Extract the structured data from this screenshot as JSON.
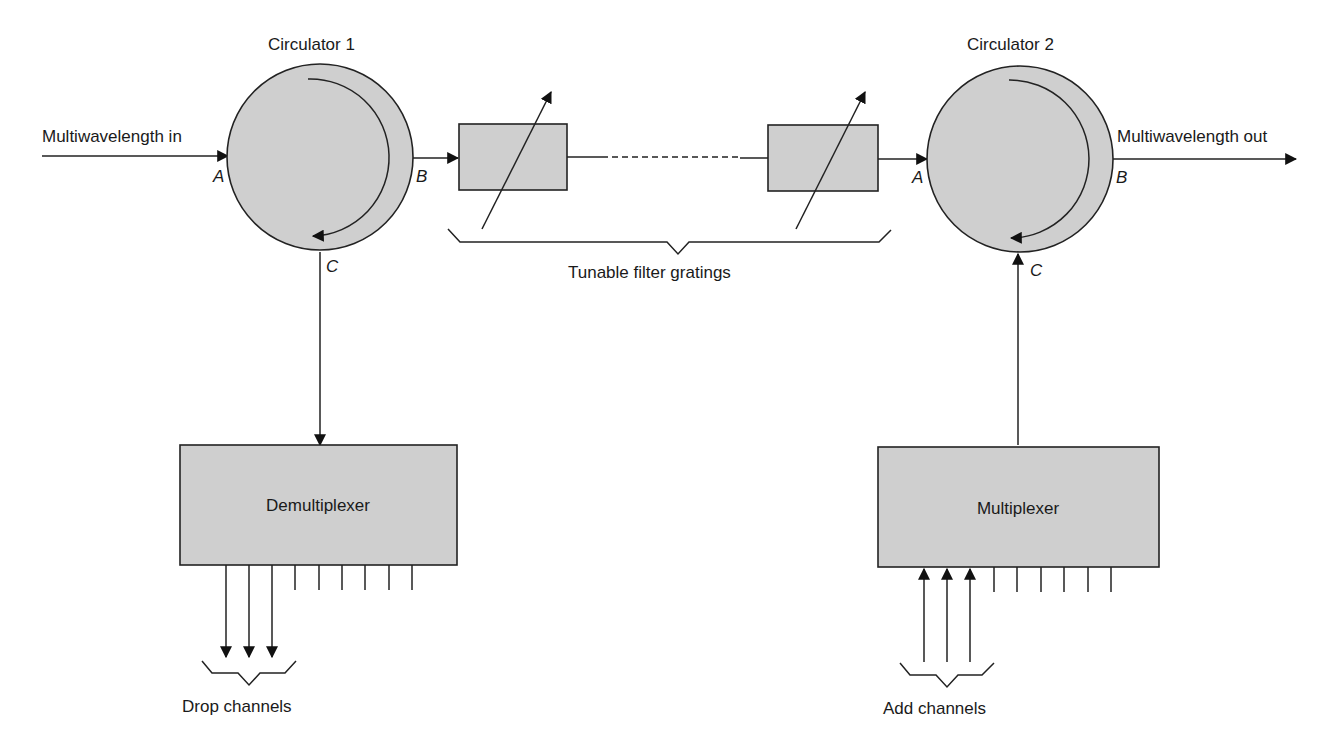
{
  "diagram": {
    "type": "optical add-drop multiplexer",
    "circulator1": {
      "label": "Circulator 1",
      "ports": {
        "a": "A",
        "b": "B",
        "c": "C"
      }
    },
    "circulator2": {
      "label": "Circulator 2",
      "ports": {
        "a": "A",
        "b": "B",
        "c": "C"
      }
    },
    "input_label": "Multiwavelength in",
    "output_label": "Multiwavelength out",
    "gratings_label": "Tunable filter gratings",
    "demux_label": "Demultiplexer",
    "mux_label": "Multiplexer",
    "drop_label": "Drop channels",
    "add_label": "Add channels",
    "colors": {
      "fill": "#cfcfcf",
      "stroke": "#222222"
    }
  }
}
